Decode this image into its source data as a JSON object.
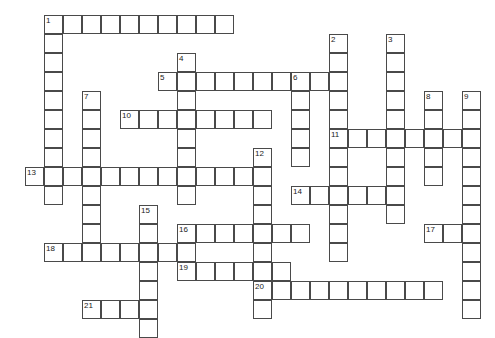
{
  "puzzle": {
    "title": "Crossword Puzzle Grid",
    "cell_size_px": 19,
    "origin_x_px": 6,
    "origin_y_px": 15,
    "grid_columns": 26,
    "grid_rows": 17,
    "cell_border_color": "#4a4a4a",
    "cell_fill_color": "#ffffff",
    "background_color": "#ffffff",
    "number_color": "#1a1a1a"
  },
  "entries": [
    {
      "number": "1",
      "direction": "across",
      "col": 2,
      "row": 0,
      "length": 10
    },
    {
      "number": "1",
      "direction": "down",
      "col": 2,
      "row": 0,
      "length": 10
    },
    {
      "number": "2",
      "direction": "down",
      "col": 17,
      "row": 1,
      "length": 12
    },
    {
      "number": "3",
      "direction": "down",
      "col": 20,
      "row": 1,
      "length": 10
    },
    {
      "number": "4",
      "direction": "down",
      "col": 9,
      "row": 2,
      "length": 8
    },
    {
      "number": "5",
      "direction": "across",
      "col": 8,
      "row": 3,
      "length": 10
    },
    {
      "number": "6",
      "direction": "down",
      "col": 15,
      "row": 3,
      "length": 5
    },
    {
      "number": "7",
      "direction": "down",
      "col": 4,
      "row": 4,
      "length": 9
    },
    {
      "number": "8",
      "direction": "down",
      "col": 22,
      "row": 4,
      "length": 5
    },
    {
      "number": "9",
      "direction": "down",
      "col": 24,
      "row": 4,
      "length": 12
    },
    {
      "number": "10",
      "direction": "across",
      "col": 6,
      "row": 5,
      "length": 8
    },
    {
      "number": "11",
      "direction": "across",
      "col": 17,
      "row": 6,
      "length": 8
    },
    {
      "number": "12",
      "direction": "down",
      "col": 13,
      "row": 7,
      "length": 9
    },
    {
      "number": "13",
      "direction": "across",
      "col": 1,
      "row": 8,
      "length": 13
    },
    {
      "number": "14",
      "direction": "across",
      "col": 15,
      "row": 9,
      "length": 5
    },
    {
      "number": "15",
      "direction": "down",
      "col": 7,
      "row": 10,
      "length": 7
    },
    {
      "number": "16",
      "direction": "across",
      "col": 9,
      "row": 11,
      "length": 7
    },
    {
      "number": "17",
      "direction": "across",
      "col": 22,
      "row": 11,
      "length": 3
    },
    {
      "number": "18",
      "direction": "across",
      "col": 2,
      "row": 12,
      "length": 8
    },
    {
      "number": "19",
      "direction": "across",
      "col": 9,
      "row": 13,
      "length": 6
    },
    {
      "number": "20",
      "direction": "across",
      "col": 13,
      "row": 14,
      "length": 10
    },
    {
      "number": "21",
      "direction": "across",
      "col": 4,
      "row": 15,
      "length": 4
    }
  ]
}
